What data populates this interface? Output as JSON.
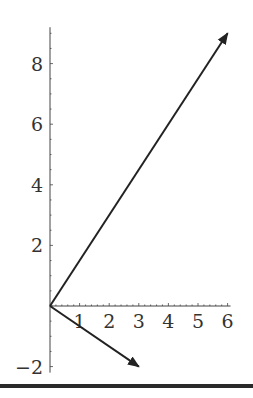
{
  "chart_data": {
    "type": "line",
    "title": "",
    "xlabel": "",
    "ylabel": "",
    "xlim": [
      0,
      6.1
    ],
    "ylim": [
      -2.2,
      9.2
    ],
    "grid": false,
    "legend": null,
    "x_ticks": [
      1,
      2,
      3,
      4,
      5,
      6
    ],
    "x_tick_labels": [
      "1",
      "2",
      "3",
      "4",
      "5",
      "6"
    ],
    "y_ticks": [
      -2,
      2,
      4,
      6,
      8
    ],
    "y_tick_labels": [
      "−2",
      "2",
      "4",
      "6",
      "8"
    ],
    "series": [
      {
        "name": "vector-1",
        "kind": "arrow",
        "from": [
          0,
          0
        ],
        "to": [
          6,
          9
        ]
      },
      {
        "name": "vector-2",
        "kind": "arrow",
        "from": [
          0,
          0
        ],
        "to": [
          3,
          -2
        ]
      }
    ],
    "colors": {
      "line": "#222222",
      "axis": "#444444",
      "text": "#333333"
    }
  }
}
